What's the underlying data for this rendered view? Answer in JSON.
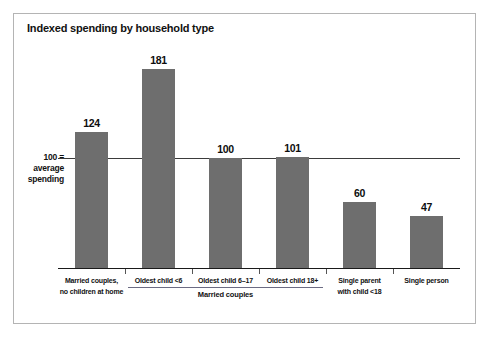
{
  "chart_data": {
    "type": "bar",
    "title": "Indexed spending by household type",
    "xlabel": "",
    "ylabel": "",
    "ylim": [
      0,
      200
    ],
    "grid": false,
    "legend": "none",
    "reference_line": {
      "value": 100,
      "label_lines": [
        "100 =",
        "average",
        "spending"
      ]
    },
    "group_bracket": {
      "label": "Married couples",
      "covers": [
        "Oldest child <6",
        "Oldest child 6–17",
        "Oldest child 18+"
      ]
    },
    "categories": [
      "Married couples, no children at home",
      "Oldest child <6",
      "Oldest child 6–17",
      "Oldest child 18+",
      "Single parent with child <18",
      "Single person"
    ],
    "category_label_lines": [
      [
        "Married couples,",
        "no children at home"
      ],
      [
        "Oldest child <6"
      ],
      [
        "Oldest child 6–17"
      ],
      [
        "Oldest child 18+"
      ],
      [
        "Single parent",
        "with child <18"
      ],
      [
        "Single person"
      ]
    ],
    "values": [
      124,
      181,
      100,
      101,
      60,
      47
    ],
    "value_labels": [
      "124",
      "181",
      "100",
      "101",
      "60",
      "47"
    ],
    "colors": {
      "bar": "#6e6e6e",
      "baseline": "#1a1a1a",
      "reference_line": "#3b3b3b",
      "frame": "#b4b4b4",
      "text": "#111111",
      "background": "#ffffff"
    }
  }
}
